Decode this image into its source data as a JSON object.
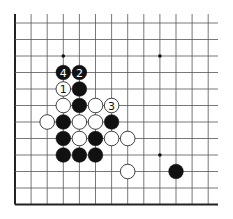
{
  "board": {
    "origin_x": 15,
    "origin_y": 23,
    "spacing_x": 16.1,
    "spacing_y": 16.5,
    "cols": 13,
    "rows": 12,
    "right_extent": 218,
    "top_extent": 14,
    "left_edge_thick": true,
    "bottom_edge_thick": true,
    "line_color": "#555555",
    "edge_color": "#222222",
    "stone_radius": 7.3
  },
  "hoshi": [
    {
      "col": 3,
      "row": 2
    },
    {
      "col": 9,
      "row": 2
    },
    {
      "col": 9,
      "row": 8
    }
  ],
  "stones": [
    {
      "col": 3,
      "row": 3,
      "color": "black",
      "label": "4"
    },
    {
      "col": 4,
      "row": 3,
      "color": "black",
      "label": "2"
    },
    {
      "col": 3,
      "row": 4,
      "color": "white",
      "label": "1"
    },
    {
      "col": 4,
      "row": 4,
      "color": "black",
      "label": ""
    },
    {
      "col": 3,
      "row": 5,
      "color": "white",
      "label": ""
    },
    {
      "col": 4,
      "row": 5,
      "color": "black",
      "label": ""
    },
    {
      "col": 5,
      "row": 5,
      "color": "white",
      "label": ""
    },
    {
      "col": 6,
      "row": 5,
      "color": "white",
      "label": "3"
    },
    {
      "col": 2,
      "row": 6,
      "color": "white",
      "label": ""
    },
    {
      "col": 3,
      "row": 6,
      "color": "black",
      "label": ""
    },
    {
      "col": 4,
      "row": 6,
      "color": "white",
      "label": ""
    },
    {
      "col": 5,
      "row": 6,
      "color": "white",
      "label": ""
    },
    {
      "col": 6,
      "row": 6,
      "color": "black",
      "label": ""
    },
    {
      "col": 3,
      "row": 7,
      "color": "black",
      "label": ""
    },
    {
      "col": 4,
      "row": 7,
      "color": "white",
      "label": ""
    },
    {
      "col": 5,
      "row": 7,
      "color": "black",
      "label": ""
    },
    {
      "col": 6,
      "row": 7,
      "color": "white",
      "label": ""
    },
    {
      "col": 7,
      "row": 7,
      "color": "white",
      "label": ""
    },
    {
      "col": 3,
      "row": 8,
      "color": "black",
      "label": ""
    },
    {
      "col": 4,
      "row": 8,
      "color": "black",
      "label": ""
    },
    {
      "col": 5,
      "row": 8,
      "color": "black",
      "label": ""
    },
    {
      "col": 7,
      "row": 9,
      "color": "white",
      "label": ""
    },
    {
      "col": 10,
      "row": 9,
      "color": "black",
      "label": ""
    }
  ]
}
